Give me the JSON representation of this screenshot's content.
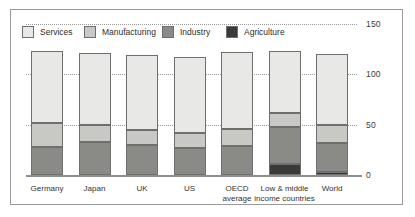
{
  "chart_data": {
    "type": "bar",
    "title": "",
    "subtitle": "",
    "xlabel": "",
    "ylabel": "",
    "stacked": true,
    "grid": true,
    "legend_position": "top-left",
    "ylim": [
      0,
      150
    ],
    "yticks": [
      0,
      50,
      100,
      150
    ],
    "ytick_labels": [
      "0",
      "50",
      "100",
      "150"
    ],
    "categories": [
      "Germany",
      "Japan",
      "UK",
      "US",
      "OECD average",
      "Low & middle income countries",
      "World"
    ],
    "category_lines": [
      [
        "Germany"
      ],
      [
        "Japan"
      ],
      [
        "UK"
      ],
      [
        "US"
      ],
      [
        "OECD",
        "average"
      ],
      [
        "Low & middle",
        "income countries"
      ],
      [
        "World"
      ]
    ],
    "series": [
      {
        "name": "Agriculture",
        "color": "#3a3a38",
        "values": [
          0,
          0,
          0,
          0,
          0,
          11,
          3
        ]
      },
      {
        "name": "Industry",
        "color": "#8a8a86",
        "values": [
          28,
          33,
          30,
          27,
          29,
          37,
          29
        ]
      },
      {
        "name": "Manufacturing",
        "color": "#c8c8c4",
        "values": [
          24,
          17,
          15,
          15,
          17,
          14,
          18
        ]
      },
      {
        "name": "Services",
        "color": "#e8e8e6",
        "values": [
          71,
          71,
          74,
          75,
          76,
          61,
          70
        ]
      }
    ],
    "totals": [
      123,
      121,
      119,
      117,
      122,
      123,
      120
    ]
  },
  "legend": {
    "items": [
      {
        "label": "Services",
        "color": "#e8e8e6"
      },
      {
        "label": "Manufacturing",
        "color": "#c8c8c4"
      },
      {
        "label": "Industry",
        "color": "#8a8a86"
      },
      {
        "label": "Agriculture",
        "color": "#3a3a38"
      }
    ]
  }
}
